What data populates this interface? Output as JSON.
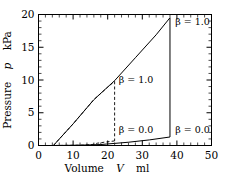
{
  "chart_data": {
    "type": "line",
    "title": "",
    "xlabel": "Volume   V   ml",
    "ylabel": "Pressure   p   kPa",
    "xlim": [
      0,
      50
    ],
    "ylim": [
      0,
      20
    ],
    "xticks": [
      0,
      10,
      20,
      30,
      40,
      50
    ],
    "yticks": [
      0,
      5,
      10,
      15,
      20
    ],
    "xtick_labels": [
      "0",
      "10",
      "20",
      "30",
      "40",
      "50"
    ],
    "ytick_labels": [
      "0",
      "5",
      "10",
      "15",
      "20"
    ],
    "minor_ticks_per_interval": 4,
    "grid": false,
    "legend": "none",
    "series": [
      {
        "name": "beta = 1.0 (inflation, solid)",
        "style": "solid",
        "points": [
          [
            4.3,
            0.0
          ],
          [
            10.0,
            3.3
          ],
          [
            16.0,
            7.0
          ],
          [
            22.0,
            9.9
          ],
          [
            28.0,
            13.4
          ],
          [
            34.0,
            16.9
          ],
          [
            38.0,
            19.5
          ]
        ]
      },
      {
        "name": "beta = 1.0 (deflation drop, solid)",
        "style": "solid",
        "points": [
          [
            38.0,
            19.5
          ],
          [
            38.0,
            1.3
          ]
        ]
      },
      {
        "name": "beta = 1.0 (deflation limb, solid)",
        "style": "solid",
        "points": [
          [
            38.0,
            1.3
          ],
          [
            32.0,
            0.85
          ],
          [
            26.0,
            0.5
          ],
          [
            22.0,
            0.32
          ],
          [
            18.0,
            0.15
          ],
          [
            12.0,
            0.05
          ],
          [
            4.3,
            0.0
          ]
        ]
      },
      {
        "name": "beta = 0.0 (inflation, dashed)",
        "style": "dashed",
        "points": [
          [
            4.3,
            0.0
          ],
          [
            10.0,
            3.3
          ],
          [
            16.0,
            7.0
          ],
          [
            20.0,
            8.9
          ],
          [
            22.0,
            9.8
          ]
        ]
      },
      {
        "name": "beta = 0.0 (deflation drop, dashed)",
        "style": "dashed",
        "points": [
          [
            22.0,
            9.8
          ],
          [
            22.0,
            0.7
          ]
        ]
      },
      {
        "name": "beta = 0.0 (deflation limb, dashed)",
        "style": "dashed",
        "points": [
          [
            22.0,
            0.7
          ],
          [
            19.0,
            0.5
          ],
          [
            17.0,
            0.35
          ],
          [
            15.5,
            0.15
          ],
          [
            13.0,
            0.05
          ],
          [
            4.3,
            0.0
          ]
        ]
      }
    ],
    "annotations": [
      {
        "id": "beta-top-right",
        "text": "β = 1.0",
        "x": 39.5,
        "y": 18.4
      },
      {
        "id": "beta-middle",
        "text": "β = 1.0",
        "x": 23.2,
        "y": 9.6
      },
      {
        "id": "beta-lower-left",
        "text": "β = 0.0",
        "x": 23.2,
        "y": 1.9
      },
      {
        "id": "beta-lower-right",
        "text": "β = 0.0",
        "x": 39.5,
        "y": 1.9
      }
    ]
  },
  "axis": {
    "x_title_parts": {
      "name": "Volume",
      "symbol": "V",
      "unit": "ml"
    },
    "y_title_parts": {
      "name": "Pressure",
      "symbol": "p",
      "unit": "kPa"
    }
  }
}
